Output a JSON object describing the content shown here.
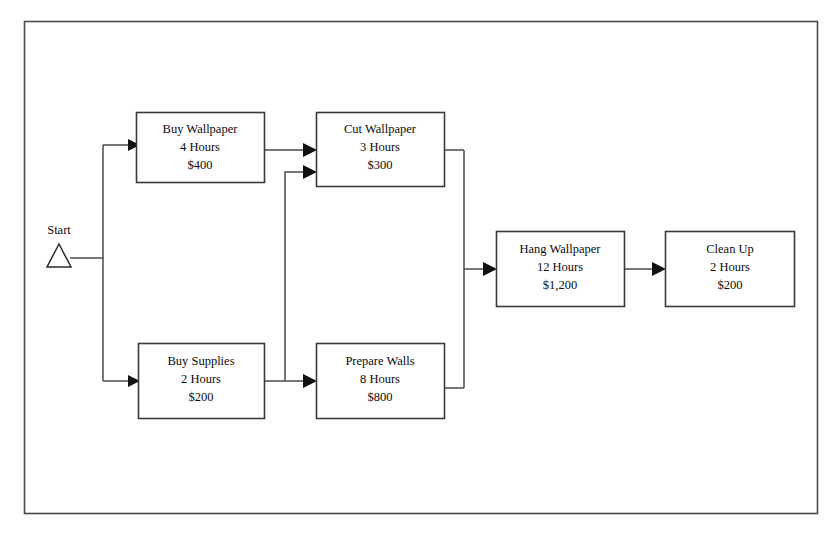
{
  "diagram": {
    "type": "activity-network-flowchart",
    "frame": {
      "stroke_color": "#4a4a4a"
    },
    "start": {
      "label": "Start",
      "marker": "triangle-outline-icon"
    },
    "nodes": [
      {
        "id": "buy-wallpaper",
        "name": "Buy Wallpaper",
        "duration": "4 Hours",
        "cost": "$400"
      },
      {
        "id": "cut-wallpaper",
        "name": "Cut Wallpaper",
        "duration": "3 Hours",
        "cost": "$300"
      },
      {
        "id": "buy-supplies",
        "name": "Buy Supplies",
        "duration": "2 Hours",
        "cost": "$200"
      },
      {
        "id": "prepare-walls",
        "name": "Prepare Walls",
        "duration": "8 Hours",
        "cost": "$800"
      },
      {
        "id": "hang-wallpaper",
        "name": "Hang Wallpaper",
        "duration": "12 Hours",
        "cost": "$1,200"
      },
      {
        "id": "clean-up",
        "name": "Clean Up",
        "duration": "2 Hours",
        "cost": "$200"
      }
    ],
    "edges": [
      {
        "from": "start",
        "to": "buy-wallpaper"
      },
      {
        "from": "start",
        "to": "buy-supplies"
      },
      {
        "from": "buy-wallpaper",
        "to": "cut-wallpaper"
      },
      {
        "from": "buy-supplies",
        "to": "cut-wallpaper"
      },
      {
        "from": "buy-supplies",
        "to": "prepare-walls"
      },
      {
        "from": "cut-wallpaper",
        "to": "hang-wallpaper"
      },
      {
        "from": "prepare-walls",
        "to": "hang-wallpaper"
      },
      {
        "from": "hang-wallpaper",
        "to": "clean-up"
      }
    ]
  }
}
